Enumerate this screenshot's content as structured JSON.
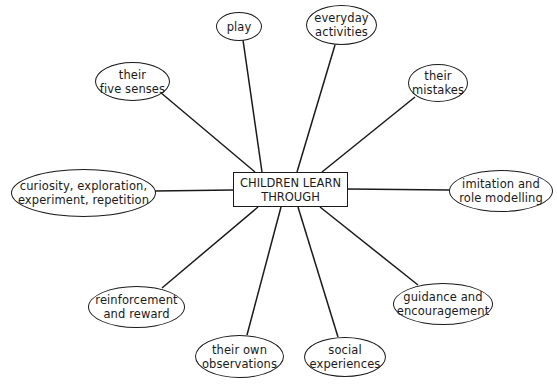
{
  "diagram": {
    "center": {
      "label": "CHILDREN LEARN\nTHROUGH"
    },
    "nodes": [
      {
        "id": "play",
        "label": "play"
      },
      {
        "id": "everyday",
        "label": "everyday\nactivities"
      },
      {
        "id": "mistakes",
        "label": "their\nmistakes"
      },
      {
        "id": "imitation",
        "label": "imitation and\nrole modelling"
      },
      {
        "id": "guidance",
        "label": "guidance and\nencouragement"
      },
      {
        "id": "social",
        "label": "social\nexperiences"
      },
      {
        "id": "observations",
        "label": "their own\nobservations"
      },
      {
        "id": "reinforcement",
        "label": "reinforcement\nand reward"
      },
      {
        "id": "curiosity",
        "label": "curiosity, exploration,\nexperiment, repetition"
      },
      {
        "id": "senses",
        "label": "their\nfive senses"
      }
    ],
    "line_color": "#1a1a1a"
  }
}
